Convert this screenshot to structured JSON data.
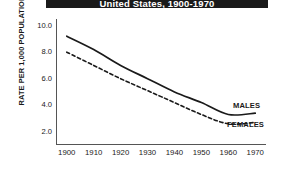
{
  "chart_data": {
    "type": "line",
    "title": "United States, 1900-1970",
    "xlabel": "",
    "ylabel": "RATE PER 1,000 POPULATION",
    "x": [
      1900,
      1910,
      1920,
      1930,
      1940,
      1950,
      1960,
      1970
    ],
    "xticks": [
      "1900",
      "1910",
      "1920",
      "1930",
      "1940",
      "1950",
      "1960",
      "1970"
    ],
    "yticks": [
      "2.0",
      "4.0",
      "6.0",
      "8.0",
      "10.0"
    ],
    "ytick_values": [
      2.0,
      4.0,
      6.0,
      8.0,
      10.0
    ],
    "xlim": [
      1896,
      1974
    ],
    "ylim": [
      1.0,
      10.5
    ],
    "grid": false,
    "legend_position": "inline-right",
    "series": [
      {
        "name": "MALES",
        "label": "MALES",
        "style": "solid",
        "color": "#1a1a1a",
        "values": [
          9.2,
          8.2,
          7.0,
          6.0,
          5.0,
          4.2,
          3.3,
          3.4
        ]
      },
      {
        "name": "FEMALES",
        "label": "FEMALES",
        "style": "dashed",
        "color": "#1a1a1a",
        "values": [
          8.0,
          7.0,
          6.0,
          5.1,
          4.2,
          3.3,
          2.6,
          2.7
        ]
      }
    ]
  }
}
